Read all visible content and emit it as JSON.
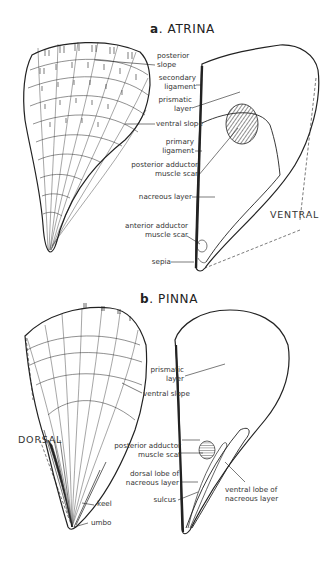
{
  "figure_a": {
    "letter": "a",
    "title": "ATRINA",
    "labels": {
      "posterior_slope": [
        "posterior",
        "slope"
      ],
      "secondary_ligament": [
        "secondary",
        "ligament"
      ],
      "prismatic_layer": [
        "prismatic",
        "layer"
      ],
      "ventral_slope": "ventral slope",
      "primary_ligament": [
        "primary",
        "ligament"
      ],
      "posterior_adductor": [
        "posterior adductor",
        "muscle scar"
      ],
      "nacreous_layer": "nacreous layer",
      "anterior_adductor": [
        "anterior adductor",
        "muscle scar"
      ],
      "sepia": "sepia",
      "ventral": "VENTRAL"
    }
  },
  "figure_b": {
    "letter": "b",
    "title": "PINNA",
    "labels": {
      "prismatic_layer": [
        "prismatic",
        "layer"
      ],
      "ventral_slope": "ventral slope",
      "posterior_adductor": [
        "posterior adductor",
        "muscle scar"
      ],
      "dorsal_lobe": [
        "dorsal lobe of",
        "nacreous layer"
      ],
      "sulcus": "sulcus",
      "ventral_lobe": [
        "ventral lobe of",
        "nacreous layer"
      ],
      "keel": "keel",
      "umbo": "umbo",
      "dorsal": "DORSAL"
    }
  }
}
